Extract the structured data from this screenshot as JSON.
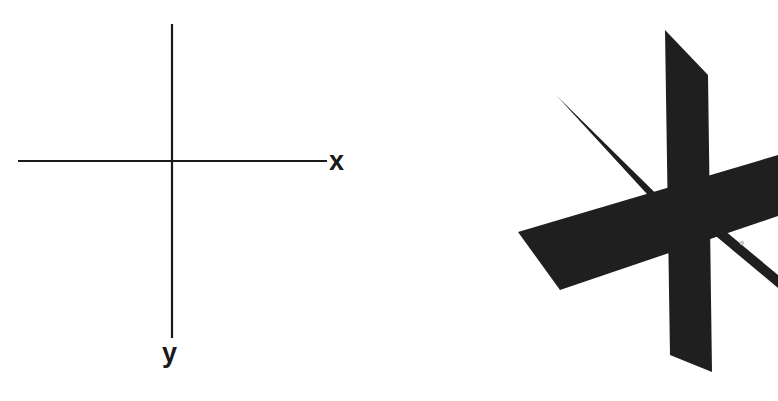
{
  "figure": {
    "background_color": "#ffffff",
    "ink_color": "#1a1a1a",
    "width": 778,
    "height": 401,
    "panels": [
      {
        "id": "two-dimensional-axes",
        "description": "Plane Cartesian coordinate system with horizontal x-axis and vertical y-axis crossing at the origin"
      },
      {
        "id": "three-dimensional-axes",
        "description": "Three-dimensional coordinate system drawn as solid shaded planes and bars, with a vertical plane labelled z, a horizontal ribbon, and two thin diagonal bars"
      }
    ]
  },
  "panel_2d": {
    "name": "plane-coordinate-system",
    "x_axis": {
      "label": "x",
      "line": {
        "x1": 18,
        "y1": 161,
        "x2": 327,
        "y2": 161
      },
      "stroke_width": 2.2
    },
    "y_axis": {
      "label": "y",
      "line": {
        "x1": 172,
        "y1": 24,
        "x2": 172,
        "y2": 338
      },
      "stroke_width": 2.2
    },
    "origin": {
      "x": 172,
      "y": 161
    }
  },
  "panel_3d": {
    "name": "space-coordinate-system",
    "z_label": "z",
    "vertical_plane": {
      "name": "z-plane",
      "points": "265,30 308,75 312,372 270,355"
    },
    "horizontal_ribbon": {
      "name": "x-ribbon",
      "points": "118,232 378,155 378,216 160,290"
    },
    "diagonal_bar_upper_left": {
      "name": "upper-left-bar",
      "points": "156,95 162,101 300,237 292,243"
    },
    "diagonal_bar_lower_right": {
      "name": "lower-right-bar",
      "points": "268,196 276,190 378,275 378,288"
    },
    "highlight_dot": {
      "cx": 342,
      "cy": 243,
      "r": 2.2
    }
  }
}
